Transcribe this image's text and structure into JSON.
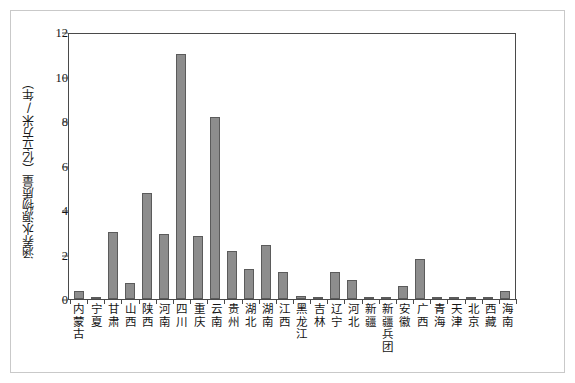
{
  "chart_data": {
    "type": "bar",
    "title": "",
    "xlabel": "",
    "ylabel": "涵养水源物质量（亿立方米/年）",
    "ylim": [
      0,
      12
    ],
    "yticks": [
      0,
      2,
      4,
      6,
      8,
      10,
      12
    ],
    "grid": false,
    "legend": null,
    "bar_color": "#8d8d8d",
    "bar_border_color": "#5b5b5b",
    "axis_color": "#4a4a4a",
    "categories": [
      "内蒙古",
      "宁夏",
      "甘肃",
      "山西",
      "陕西",
      "河南",
      "四川",
      "重庆",
      "云南",
      "贵州",
      "湖北",
      "湖南",
      "江西",
      "黑龙江",
      "吉林",
      "辽宁",
      "河北",
      "新疆",
      "新疆兵团",
      "安徽",
      "广西",
      "青海",
      "天津",
      "北京",
      "西藏",
      "海南"
    ],
    "values": [
      0.35,
      0.02,
      3.0,
      0.7,
      4.75,
      2.9,
      11.0,
      2.85,
      8.2,
      2.15,
      1.35,
      2.45,
      1.2,
      0.12,
      0.1,
      1.2,
      0.85,
      0.06,
      0.08,
      0.6,
      1.8,
      0.03,
      0.02,
      0.05,
      0.02,
      0.38
    ]
  }
}
